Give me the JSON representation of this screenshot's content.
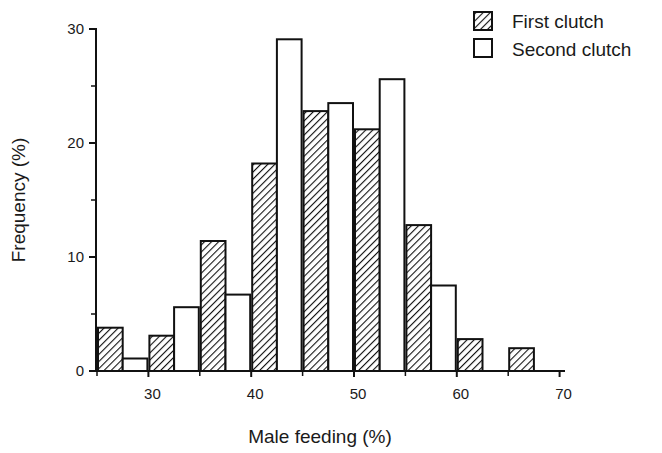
{
  "chart_data": {
    "type": "bar",
    "title": "",
    "xlabel": "Male feeding (%)",
    "ylabel": "Frequency (%)",
    "bin_width": 5,
    "categories": [
      "25-30",
      "30-35",
      "35-40",
      "40-45",
      "45-50",
      "50-55",
      "55-60",
      "60-65",
      "65-70"
    ],
    "bin_starts": [
      25,
      30,
      35,
      40,
      45,
      50,
      55,
      60,
      65
    ],
    "series": [
      {
        "name": "First clutch",
        "pattern": "hatched",
        "values": [
          3.8,
          3.1,
          11.4,
          18.2,
          22.8,
          21.2,
          12.8,
          2.8,
          2.0
        ]
      },
      {
        "name": "Second clutch",
        "pattern": "open",
        "values": [
          1.1,
          5.6,
          6.7,
          29.1,
          23.5,
          25.6,
          7.5,
          0,
          0
        ]
      }
    ],
    "x_ticks": [
      30,
      40,
      50,
      60,
      70
    ],
    "x_minor_ticks": [
      25,
      35,
      45,
      55,
      65
    ],
    "y_ticks": [
      0,
      10,
      20,
      30
    ],
    "y_minor_ticks": [
      5,
      15,
      25
    ],
    "xlim": [
      25,
      70
    ],
    "ylim": [
      0,
      30
    ],
    "grid": false,
    "legend_position": "top-right"
  },
  "labels": {
    "x_axis_title": "Male feeding (%)",
    "y_axis_title": "Frequency (%)",
    "x_tick_labels": [
      "30",
      "40",
      "50",
      "60",
      "70"
    ],
    "y_tick_labels": [
      "0",
      "10",
      "20",
      "30"
    ],
    "legend": [
      "First clutch",
      "Second clutch"
    ]
  },
  "colors": {
    "ink": "#111111",
    "background": "#ffffff"
  }
}
